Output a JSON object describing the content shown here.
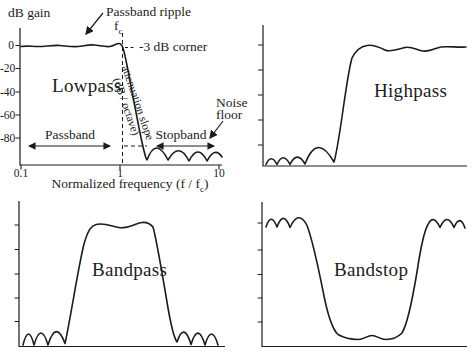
{
  "colors": {
    "background": "#ffffff",
    "ink": "#1c1c1c"
  },
  "panels": {
    "lowpass": {
      "title": "Lowpass",
      "y_axis_label": "dB gain",
      "y_ticks": [
        "0",
        "-20",
        "-40",
        "-60",
        "-80"
      ],
      "x_ticks": [
        "0.1",
        "1",
        "10"
      ],
      "x_axis_label": {
        "prefix": "Normalized frequency (f / f",
        "sub": "c",
        "suffix": ")"
      },
      "annotations": {
        "passband_ripple": "Passband ripple",
        "cutoff_frequency": {
          "base": "f",
          "sub": "c"
        },
        "corner": "-3 dB corner",
        "attenuation_slope_line1": "attenuation slope",
        "attenuation_slope_line2": "(dB / octave)",
        "noise_floor_line1": "Noise",
        "noise_floor_line2": "floor",
        "passband": "Passband",
        "stopband": "Stopband"
      }
    },
    "highpass": {
      "title": "Highpass"
    },
    "bandpass": {
      "title": "Bandpass"
    },
    "bandstop": {
      "title": "Bandstop"
    }
  }
}
